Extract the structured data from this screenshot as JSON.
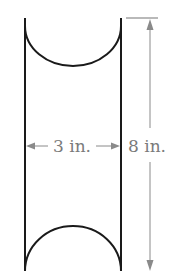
{
  "diagram": {
    "width_label": "3 in.",
    "height_label": "8 in.",
    "colors": {
      "outline": "#1a1a1a",
      "dimension": "#8a8a8a",
      "text": "#7a7a7a",
      "background": "#ffffff"
    }
  }
}
